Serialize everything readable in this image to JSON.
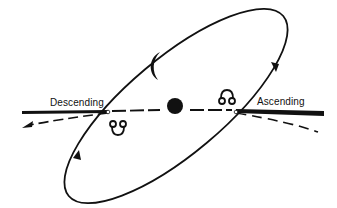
{
  "diagram": {
    "labels": {
      "descending": "Descending",
      "ascending": "Ascending"
    },
    "symbols": {
      "descending_node": "☋",
      "ascending_node": "☊",
      "moon": "crescent-moon",
      "earth": "earth-disk"
    },
    "colors": {
      "ink": "#111111",
      "background": "#ffffff"
    }
  }
}
